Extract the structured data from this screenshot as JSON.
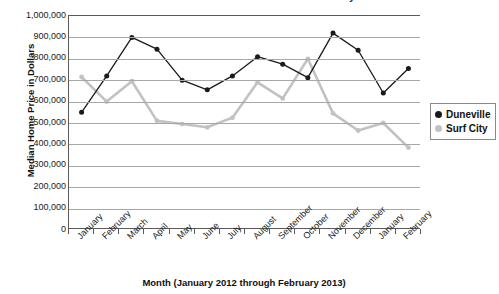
{
  "chart_data": {
    "type": "line",
    "title": "Median Home Prices in Duneville and Surf City",
    "xlabel": "Month (January 2012 through February 2013)",
    "ylabel": "Median Home Price in Dollars",
    "categories": [
      "January",
      "February",
      "March",
      "April",
      "May",
      "June",
      "July",
      "August",
      "September",
      "October",
      "November",
      "December",
      "January",
      "February"
    ],
    "ylim": [
      0,
      1000000
    ],
    "ytick_values": [
      0,
      100000,
      200000,
      300000,
      400000,
      500000,
      600000,
      700000,
      800000,
      900000,
      1000000
    ],
    "ytick_labels": [
      "0",
      "100,000",
      "200,000",
      "300,000",
      "400,000",
      "500,000",
      "600,000",
      "700,000",
      "800,000",
      "900,000",
      "1,000,000"
    ],
    "grid": true,
    "legend_position": "right",
    "series": [
      {
        "name": "Duneville",
        "color": "#1a1a1a",
        "values": [
          550000,
          720000,
          900000,
          845000,
          700000,
          655000,
          720000,
          810000,
          775000,
          712000,
          920000,
          840000,
          640000,
          755000
        ]
      },
      {
        "name": "Surf City",
        "color": "#c2c2c2",
        "values": [
          715000,
          600000,
          695000,
          510000,
          495000,
          480000,
          525000,
          690000,
          615000,
          800000,
          545000,
          465000,
          500000,
          385000
        ]
      }
    ]
  },
  "legend": {
    "entries": [
      {
        "label": "Duneville",
        "color": "#1a1a1a"
      },
      {
        "label": "Surf City",
        "color": "#c2c2c2"
      }
    ]
  }
}
